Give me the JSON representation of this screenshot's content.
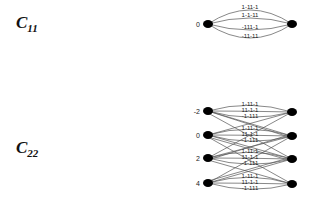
{
  "figure": {
    "c11": {
      "label_main": "C",
      "label_sub": "11",
      "node_label": "0",
      "edge_labels": [
        "1-11-1",
        "1-1-11",
        "-111-1",
        "-11-11"
      ]
    },
    "c22": {
      "label_main": "C",
      "label_sub": "22",
      "node_labels": [
        "-2",
        "0",
        "2",
        "4"
      ],
      "groups": [
        [
          "1-11-1",
          "11-1-1",
          "-1-111"
        ],
        [
          "1-11-1",
          "11-1-1",
          "-1-111"
        ],
        [
          "1-11-1",
          "11-1-1",
          "-1-111"
        ],
        [
          "1-11-1",
          "11-1-1",
          "-1-111"
        ]
      ]
    }
  }
}
